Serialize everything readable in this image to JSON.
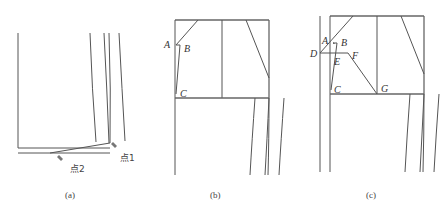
{
  "panels": [
    {
      "id": "a",
      "caption": "(a)",
      "annotations": [
        "点1",
        "点2"
      ]
    },
    {
      "id": "b",
      "caption": "(b)",
      "points": [
        "A",
        "B",
        "C"
      ]
    },
    {
      "id": "c",
      "caption": "(c)",
      "points": [
        "A",
        "B",
        "D",
        "E",
        "F",
        "C",
        "G"
      ]
    }
  ]
}
